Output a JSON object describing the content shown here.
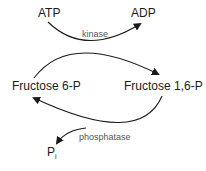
{
  "diagram": {
    "type": "reaction-cycle",
    "nodes": {
      "atp": "ATP",
      "adp": "ADP",
      "f6p": "Fructose 6-P",
      "f16p": "Fructose 1,6-P",
      "pi_base": "P",
      "pi_sub": "i"
    },
    "enzymes": {
      "top": "kinase",
      "bottom": "phosphatase"
    },
    "edges": [
      {
        "from": "Fructose 6-P",
        "to": "Fructose 1,6-P",
        "enzyme": "kinase",
        "cofactor_in": "ATP",
        "cofactor_out": "ADP"
      },
      {
        "from": "Fructose 1,6-P",
        "to": "Fructose 6-P",
        "enzyme": "phosphatase",
        "product": "Pi"
      }
    ],
    "colors": {
      "stroke": "#1a1a1a",
      "enzyme_text": "#555555"
    }
  }
}
